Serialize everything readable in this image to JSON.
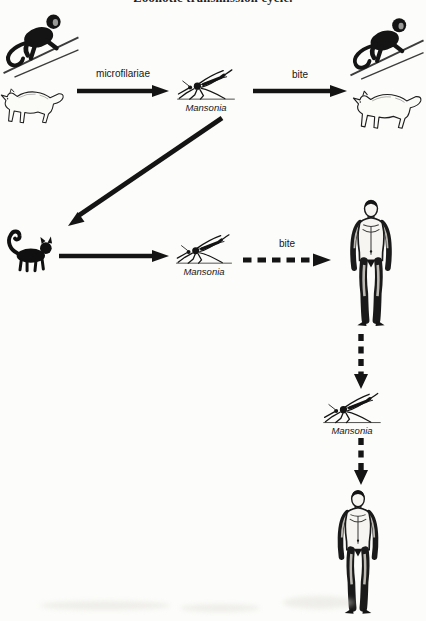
{
  "figure": {
    "title": "Zoonotic transmission cycle."
  },
  "labels": {
    "microfilariae": "microfilariae",
    "bite_sylvatic": "bite",
    "bite_human": "bite",
    "mansonia_top": "Mansonia",
    "mansonia_middle": "Mansonia",
    "mansonia_bottom": "Mansonia"
  },
  "colors": {
    "ink": "#1a1a1a",
    "paper": "#fcfcfa",
    "branch": "#3c3c3c"
  },
  "icons": {
    "monkey-icon": "black leaf-monkey silhouette climbing a branch",
    "wild-cat-icon": "outlined wild cat / fox walking left",
    "black-cat-icon": "black domestic cat silhouette, tail curled",
    "mosquito-icon": "mosquito in side view resting on a ground line",
    "human-icon": "standing human figure, anterior view",
    "solid-arrow-icon": "solid black arrow",
    "dashed-arrow-icon": "dashed black arrow"
  }
}
